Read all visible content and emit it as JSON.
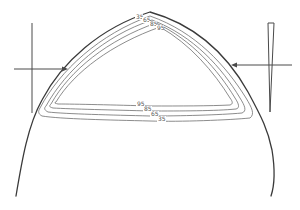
{
  "diagram": {
    "title": "",
    "contours": {
      "top_labels": [
        "35",
        "65",
        "85",
        "95"
      ],
      "bottom_labels": [
        "95",
        "85",
        "65",
        "35"
      ],
      "levels": [
        35,
        65,
        85,
        95
      ]
    },
    "left_marker": {
      "type": "vertical-line-with-arrow",
      "arrow_direction": "right"
    },
    "right_marker": {
      "type": "wedge-with-arrow",
      "arrow_direction": "left"
    },
    "colors": {
      "outline": "#3a3a3a",
      "contour": "#6f6f6f",
      "background": "#ffffff"
    }
  }
}
